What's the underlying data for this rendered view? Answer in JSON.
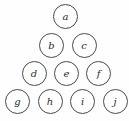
{
  "diagram": {
    "title": "",
    "type": "triangular-node-arrangement",
    "background_color": "#fefefe",
    "node_fill_color": "#ffffff",
    "node_stroke_color": "#4a4a4a",
    "label_color": "#2b2b2b",
    "node_diameter": 25,
    "row_count": 4,
    "node_count": 10,
    "rows": [
      {
        "index": 1,
        "center_y": 16.5,
        "nodes": [
          {
            "label": "a",
            "cx": 65.5,
            "cy": 16.5
          }
        ]
      },
      {
        "index": 2,
        "center_y": 45.5,
        "nodes": [
          {
            "label": "b",
            "cx": 51.5,
            "cy": 45.5
          },
          {
            "label": "c",
            "cx": 84.0,
            "cy": 45.5
          }
        ]
      },
      {
        "index": 3,
        "center_y": 73.5,
        "nodes": [
          {
            "label": "d",
            "cx": 34.0,
            "cy": 73.5
          },
          {
            "label": "e",
            "cx": 66.5,
            "cy": 73.5
          },
          {
            "label": "f",
            "cx": 98.5,
            "cy": 73.5
          }
        ]
      },
      {
        "index": 4,
        "center_y": 101.5,
        "nodes": [
          {
            "label": "g",
            "cx": 17.5,
            "cy": 101.5
          },
          {
            "label": "h",
            "cx": 50.0,
            "cy": 101.5
          },
          {
            "label": "i",
            "cx": 82.5,
            "cy": 101.5
          },
          {
            "label": "j",
            "cx": 115.0,
            "cy": 101.5
          }
        ]
      }
    ]
  }
}
